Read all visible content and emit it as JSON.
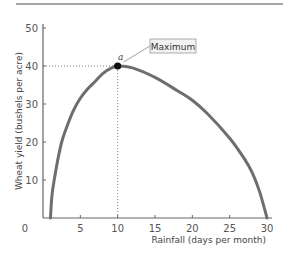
{
  "chart_data": {
    "type": "line",
    "title": "",
    "xlabel": "Rainfall (days per month)",
    "ylabel": "Wheat yield (bushels per acre)",
    "xlim": [
      0,
      30
    ],
    "ylim": [
      0,
      50
    ],
    "x_ticks": [
      0,
      5,
      10,
      15,
      20,
      25,
      30
    ],
    "y_ticks": [
      10,
      20,
      30,
      40,
      50
    ],
    "grid": false,
    "legend": null,
    "series": [
      {
        "name": "Wheat yield",
        "x": [
          1,
          1.2,
          1.5,
          2,
          2.5,
          3,
          4,
          5,
          6,
          7,
          8,
          9,
          10,
          12,
          15,
          18,
          20,
          22,
          25,
          27,
          28,
          29,
          30
        ],
        "values": [
          0,
          6,
          10,
          15.5,
          20,
          23,
          28,
          31.5,
          34,
          36,
          38,
          39.3,
          40,
          39.5,
          37,
          33.5,
          31,
          27.5,
          21,
          15.5,
          12,
          7,
          0
        ]
      }
    ],
    "annotations": [
      {
        "type": "point",
        "label": "a",
        "x": 10,
        "y": 40
      },
      {
        "type": "callout",
        "text": "Maximum",
        "x": 10,
        "y": 40
      },
      {
        "type": "dotted-guide",
        "from": [
          0,
          40
        ],
        "to": [
          10,
          40
        ]
      },
      {
        "type": "dotted-guide",
        "from": [
          10,
          0
        ],
        "to": [
          10,
          40
        ]
      }
    ]
  },
  "labels": {
    "xlabel": "Rainfall (days per month)",
    "ylabel": "Wheat yield (bushels per acre)",
    "maximum": "Maximum",
    "point_a": "a",
    "origin": "0"
  },
  "colors": {
    "curve": "#6e6e6e",
    "axis": "#666666",
    "point": "#111111",
    "callout_bg": "#f2f2f2",
    "callout_border": "#999999",
    "top_rule": "#888888"
  }
}
